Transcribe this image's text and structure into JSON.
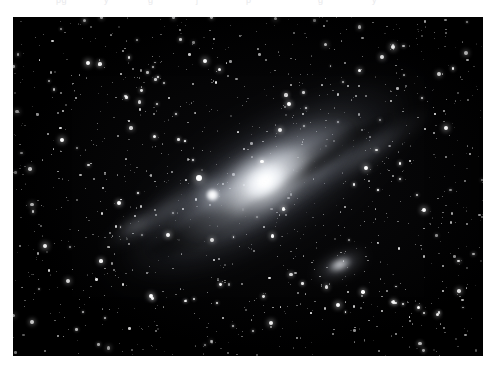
{
  "page": {
    "background_color": "#ffffff",
    "width": 496,
    "height": 377
  },
  "top_artifact": {
    "description": "clipped descenders of a cut-off text line at the very top edge",
    "color": "#e9e9ec",
    "fragments": [
      {
        "text": "pg",
        "left": 56,
        "top": -5
      },
      {
        "text": "y",
        "left": 104,
        "top": -5
      },
      {
        "text": "g",
        "left": 148,
        "top": -5
      },
      {
        "text": "j",
        "left": 196,
        "top": -5
      },
      {
        "text": "p",
        "left": 246,
        "top": -5
      },
      {
        "text": "g",
        "left": 318,
        "top": -5
      },
      {
        "text": "y",
        "left": 372,
        "top": -5
      }
    ]
  },
  "photo": {
    "title": "Andromeda Galaxy astrophotograph",
    "subject": "M31 spiral galaxy with companion galaxies",
    "frame": {
      "left": 13,
      "top": 17,
      "width": 470,
      "height": 339
    },
    "sky_color": "#000000",
    "star_color": "#ffffff",
    "galaxy": {
      "name": "M31",
      "center_x": 265,
      "center_y": 181,
      "disk_angle_deg": -32,
      "disk_length": 430,
      "disk_width": 170,
      "core_color": "#ffffff",
      "disk_color": "#c8cdd8",
      "dust_lane_color": "#000000"
    },
    "satellites": [
      {
        "name": "M32",
        "center_x": 200,
        "center_y": 178,
        "shape": "compact-round"
      },
      {
        "name": "M110",
        "center_x": 327,
        "center_y": 248,
        "shape": "elongated-elliptical",
        "angle_deg": -24
      }
    ]
  },
  "starfield": {
    "seed": 20231105,
    "count_small": 900,
    "count_medium": 230,
    "count_bright": 58,
    "bright_stars": [
      {
        "x": 199,
        "y": 178,
        "r": 3.2
      },
      {
        "x": 88,
        "y": 63,
        "r": 2.4
      },
      {
        "x": 393,
        "y": 47,
        "r": 2.3
      },
      {
        "x": 45,
        "y": 246,
        "r": 2.4
      },
      {
        "x": 338,
        "y": 305,
        "r": 2.3
      },
      {
        "x": 424,
        "y": 210,
        "r": 2.2
      },
      {
        "x": 151,
        "y": 296,
        "r": 2.2
      },
      {
        "x": 271,
        "y": 323,
        "r": 2.1
      },
      {
        "x": 62,
        "y": 140,
        "r": 2.1
      },
      {
        "x": 446,
        "y": 128,
        "r": 2.0
      },
      {
        "x": 205,
        "y": 61,
        "r": 2.0
      },
      {
        "x": 366,
        "y": 168,
        "r": 2.0
      },
      {
        "x": 119,
        "y": 203,
        "r": 1.9
      },
      {
        "x": 289,
        "y": 104,
        "r": 1.9
      },
      {
        "x": 32,
        "y": 322,
        "r": 1.9
      },
      {
        "x": 459,
        "y": 291,
        "r": 1.8
      }
    ]
  }
}
